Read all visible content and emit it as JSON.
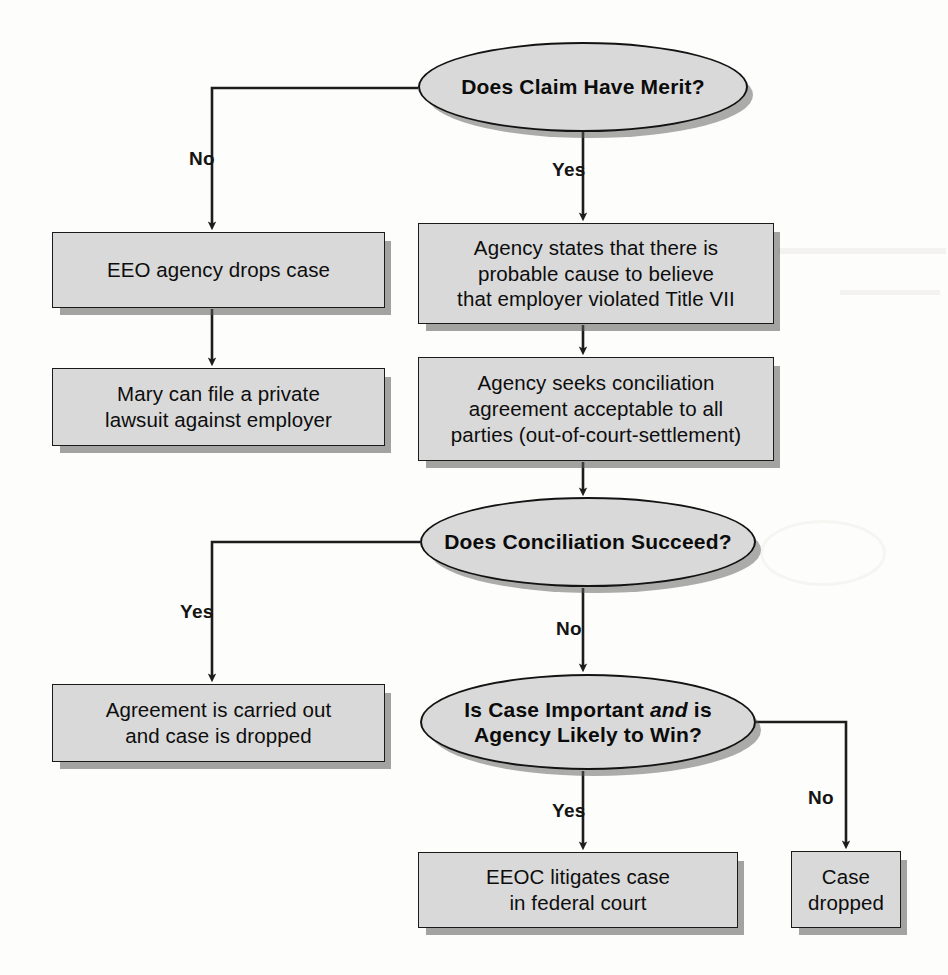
{
  "diagram": {
    "fill_color": "#d9d9d9",
    "border_color": "#131313",
    "shadow_color": "#5a5a5a",
    "background_color": "#fdfdfb",
    "nodes": [
      {
        "id": "decision-merit",
        "shape": "ellipse",
        "text": "Does Claim Have Merit?",
        "x": 418,
        "y": 42,
        "w": 330,
        "h": 90
      },
      {
        "id": "eeo-drops-case",
        "shape": "rect",
        "text": "EEO agency drops case",
        "x": 52,
        "y": 232,
        "w": 333,
        "h": 76
      },
      {
        "id": "mary-private-lawsuit",
        "shape": "rect",
        "lines": [
          "Mary can file a private",
          "lawsuit against employer"
        ],
        "x": 52,
        "y": 368,
        "w": 333,
        "h": 78
      },
      {
        "id": "agency-probable-cause",
        "shape": "rect",
        "lines": [
          "Agency states that there is",
          "probable cause to believe",
          "that employer violated Title VII"
        ],
        "x": 418,
        "y": 223,
        "w": 356,
        "h": 101
      },
      {
        "id": "agency-seeks-conciliation",
        "shape": "rect",
        "lines": [
          "Agency seeks conciliation",
          "agreement acceptable to all",
          "parties (out-of-court-settlement)"
        ],
        "x": 418,
        "y": 357,
        "w": 356,
        "h": 104
      },
      {
        "id": "decision-conciliation",
        "shape": "ellipse",
        "text": "Does Conciliation Succeed?",
        "x": 420,
        "y": 497,
        "w": 336,
        "h": 90
      },
      {
        "id": "agreement-carried-out",
        "shape": "rect",
        "lines": [
          "Agreement is carried out",
          "and case is dropped"
        ],
        "x": 52,
        "y": 684,
        "w": 333,
        "h": 78
      },
      {
        "id": "decision-case-important",
        "shape": "ellipse",
        "lines": [
          "Is Case Important <i>and</i> is",
          "Agency Likely to Win?"
        ],
        "text_plain": "Is Case Important and is Agency Likely to Win?",
        "x": 420,
        "y": 674,
        "w": 336,
        "h": 96
      },
      {
        "id": "eeoc-litigates",
        "shape": "rect",
        "lines": [
          "EEOC litigates case",
          "in federal court"
        ],
        "x": 418,
        "y": 852,
        "w": 320,
        "h": 76
      },
      {
        "id": "case-dropped",
        "shape": "rect",
        "lines": [
          "Case",
          "dropped"
        ],
        "x": 791,
        "y": 851,
        "w": 110,
        "h": 77
      }
    ],
    "edge_labels": [
      {
        "id": "merit-no",
        "text": "No",
        "x": 189,
        "y": 148
      },
      {
        "id": "merit-yes",
        "text": "Yes",
        "x": 570,
        "y": 159
      },
      {
        "id": "conciliation-yes",
        "text": "Yes",
        "x": 189,
        "y": 601
      },
      {
        "id": "conciliation-no",
        "text": "No",
        "x": 570,
        "y": 618
      },
      {
        "id": "important-yes",
        "text": "Yes",
        "x": 570,
        "y": 800
      },
      {
        "id": "important-no",
        "text": "No",
        "x": 806,
        "y": 787
      }
    ]
  }
}
